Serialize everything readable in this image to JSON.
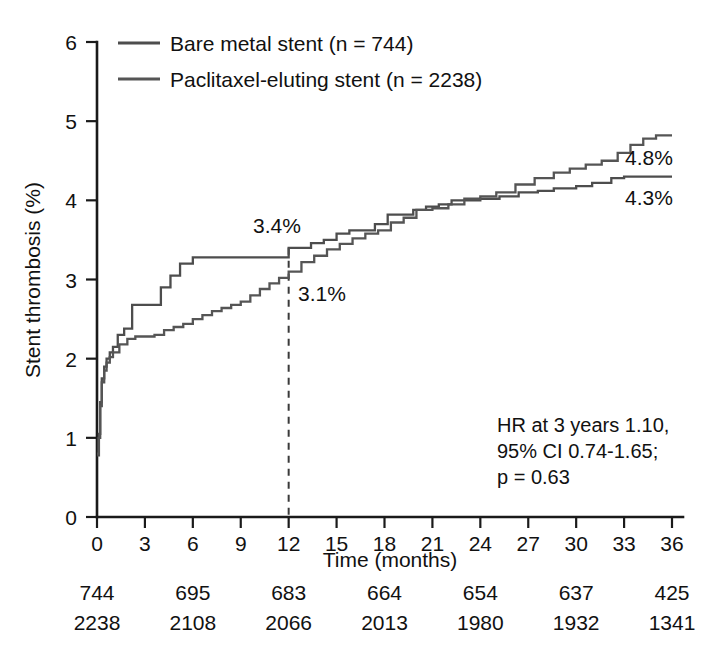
{
  "chart_data": {
    "type": "line",
    "title": "",
    "xlabel": "Time (months)",
    "ylabel": "Stent thrombosis (%)",
    "xlim": [
      0,
      36
    ],
    "ylim": [
      0,
      6
    ],
    "xticks": [
      0,
      3,
      6,
      9,
      12,
      15,
      18,
      21,
      24,
      27,
      30,
      33,
      36
    ],
    "yticks": [
      0,
      1,
      2,
      3,
      4,
      5,
      6
    ],
    "grid": false,
    "legend_position": "top-left",
    "step_style": "post",
    "series": [
      {
        "name": "Bare metal stent (n = 744)",
        "short_name": "BMS",
        "color": "#4d4d4d",
        "n": 744,
        "endpoint_label": "4.3%",
        "value_at_12mo": 3.4,
        "value_at_36mo": 4.3,
        "x": [
          0,
          0.12,
          0.2,
          0.3,
          0.45,
          0.6,
          0.8,
          1.0,
          1.3,
          1.7,
          2.2,
          2.8,
          3.4,
          4.0,
          4.6,
          5.2,
          6.0,
          7.0,
          8.2,
          9.5,
          10.8,
          12.0,
          12.6,
          13.4,
          14.2,
          15.0,
          15.8,
          16.6,
          17.4,
          18.2,
          19.0,
          19.8,
          20.6,
          21.4,
          22.2,
          23.0,
          24.0,
          25.2,
          26.4,
          27.6,
          28.6,
          30.0,
          31.0,
          32.2,
          33.0,
          36.0
        ],
        "y": [
          0.78,
          1.05,
          1.45,
          1.75,
          1.9,
          2.0,
          2.08,
          2.15,
          2.3,
          2.38,
          2.68,
          2.68,
          2.68,
          2.9,
          3.05,
          3.2,
          3.28,
          3.28,
          3.28,
          3.28,
          3.28,
          3.4,
          3.4,
          3.46,
          3.5,
          3.58,
          3.62,
          3.62,
          3.7,
          3.82,
          3.82,
          3.88,
          3.92,
          3.95,
          4.0,
          4.0,
          4.02,
          4.05,
          4.1,
          4.12,
          4.15,
          4.18,
          4.22,
          4.28,
          4.3,
          4.3
        ]
      },
      {
        "name": "Paclitaxel-eluting stent (n = 2238)",
        "short_name": "PES",
        "color": "#555555",
        "n": 2238,
        "endpoint_label": "4.8%",
        "value_at_12mo": 3.1,
        "value_at_36mo": 4.8,
        "x": [
          0,
          0.1,
          0.2,
          0.3,
          0.45,
          0.6,
          0.8,
          1.0,
          1.4,
          1.9,
          2.4,
          3.0,
          3.6,
          4.2,
          4.8,
          5.4,
          6.0,
          6.6,
          7.2,
          7.8,
          8.4,
          9.0,
          9.6,
          10.2,
          10.8,
          11.4,
          12.0,
          12.8,
          13.6,
          14.4,
          15.2,
          16.0,
          16.8,
          17.6,
          18.4,
          19.2,
          20.0,
          21.0,
          22.0,
          23.0,
          24.0,
          25.0,
          26.2,
          27.4,
          28.6,
          29.6,
          30.6,
          31.6,
          32.6,
          33.4,
          34.2,
          35.0,
          36.0
        ],
        "y": [
          0.8,
          1.0,
          1.4,
          1.7,
          1.85,
          1.95,
          2.02,
          2.08,
          2.18,
          2.25,
          2.28,
          2.28,
          2.3,
          2.36,
          2.4,
          2.44,
          2.5,
          2.55,
          2.6,
          2.64,
          2.68,
          2.72,
          2.8,
          2.88,
          2.95,
          3.02,
          3.1,
          3.22,
          3.3,
          3.38,
          3.45,
          3.52,
          3.58,
          3.62,
          3.72,
          3.78,
          3.88,
          3.9,
          3.95,
          4.02,
          4.05,
          4.1,
          4.2,
          4.28,
          4.35,
          4.4,
          4.45,
          4.5,
          4.6,
          4.7,
          4.78,
          4.82,
          4.82
        ]
      }
    ],
    "annotations": [
      {
        "id": "anno-34",
        "text": "3.4%",
        "x": 12,
        "y": 3.4,
        "note": "BMS at 12 months"
      },
      {
        "id": "anno-31",
        "text": "3.1%",
        "x": 12,
        "y": 3.1,
        "note": "PES at 12 months"
      },
      {
        "id": "anno-48",
        "text": "4.8%",
        "x": 36,
        "y": 4.8,
        "note": "PES at 36 months"
      },
      {
        "id": "anno-43",
        "text": "4.3%",
        "x": 36,
        "y": 4.3,
        "note": "BMS at 36 months"
      }
    ],
    "reference_line": {
      "x": 12,
      "style": "dashed"
    },
    "statistics": {
      "line1": "HR at 3 years 1.10,",
      "line2": "95% CI 0.74-1.65;",
      "line3": "p = 0.63"
    },
    "risk_table": {
      "times": [
        0,
        6,
        12,
        18,
        24,
        30,
        36
      ],
      "rows": [
        {
          "series": "Bare metal stent",
          "counts": [
            "744",
            "695",
            "683",
            "664",
            "654",
            "637",
            "425"
          ]
        },
        {
          "series": "Paclitaxel-eluting stent",
          "counts": [
            "2238",
            "2108",
            "2066",
            "2013",
            "1980",
            "1932",
            "1341"
          ]
        }
      ]
    }
  },
  "axis": {
    "x_title": "Time (months)",
    "y_title": "Stent thrombosis (%)",
    "x_tick_labels": [
      "0",
      "3",
      "6",
      "9",
      "12",
      "15",
      "18",
      "21",
      "24",
      "27",
      "30",
      "33",
      "36"
    ],
    "y_tick_labels": [
      "0",
      "1",
      "2",
      "3",
      "4",
      "5",
      "6"
    ]
  },
  "legend": {
    "items": [
      {
        "label": "Bare metal stent (n = 744)",
        "color": "#4d4d4d"
      },
      {
        "label": "Paclitaxel-eluting stent (n = 2238)",
        "color": "#555555"
      }
    ]
  },
  "annotations_text": {
    "bms_12mo": "3.4%",
    "pes_12mo": "3.1%",
    "pes_36mo": "4.8%",
    "bms_36mo": "4.3%"
  },
  "statistics_text": {
    "line1": "HR at 3 years 1.10,",
    "line2": "95% CI 0.74-1.65;",
    "line3": "p = 0.63"
  },
  "risk_numbers": {
    "row1": [
      "744",
      "695",
      "683",
      "664",
      "654",
      "637",
      "425"
    ],
    "row2": [
      "2238",
      "2108",
      "2066",
      "2013",
      "1980",
      "1932",
      "1341"
    ]
  }
}
